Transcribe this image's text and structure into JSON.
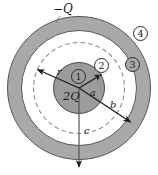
{
  "figure": {
    "type": "physics-diagram",
    "background_color": "#ffffff",
    "geometry": {
      "center_x": 79,
      "center_y": 88,
      "inner_sphere_radius": 26,
      "gaussian_dashed_radius": 46,
      "shell_inner_radius": 58,
      "shell_outer_radius": 72
    },
    "colors": {
      "inner_sphere_fill": "#9c9c9c",
      "shell_fill": "#a8a8a8",
      "gap_fill": "#ffffff",
      "outline": "#4a4a4a",
      "dashed_circle": "#8e8e8e",
      "arrow": "#1a1a1a",
      "text": "#1a1a1a"
    }
  },
  "charges": {
    "inner": "2Q",
    "shell": "−Q"
  },
  "radii_labels": {
    "r": "r",
    "a": "a",
    "b": "b",
    "c": "c"
  },
  "regions": [
    {
      "id": "1",
      "label": "1",
      "description": "inside-inner-sphere"
    },
    {
      "id": "2",
      "label": "2",
      "description": "between-sphere-and-shell"
    },
    {
      "id": "3",
      "label": "3",
      "description": "inside-shell-conductor"
    },
    {
      "id": "4",
      "label": "4",
      "description": "outside-shell"
    }
  ]
}
